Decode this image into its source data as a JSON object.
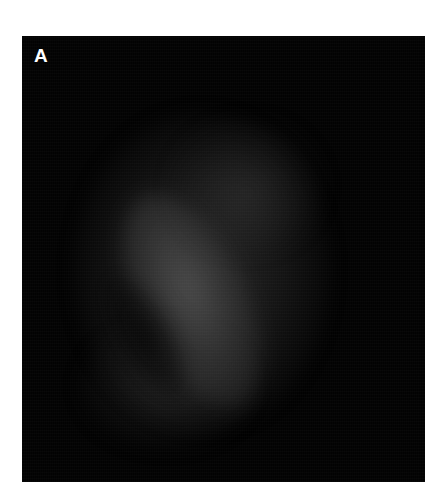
{
  "figure": {
    "panel_label": "A",
    "image": {
      "description": "grayscale fluorescence micrograph of a diffuse tissue/cell cluster with a brighter curved band",
      "background_color": "#020202",
      "signal_color": "#6a6a6a"
    }
  }
}
